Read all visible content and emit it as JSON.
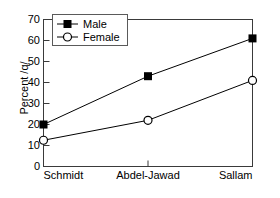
{
  "chart_data": {
    "type": "line",
    "title": "",
    "xlabel": "",
    "ylabel": "Percent /q/",
    "categories": [
      "Schmidt",
      "Abdel-Jawad",
      "Sallam"
    ],
    "series": [
      {
        "name": "Male",
        "values": [
          20,
          43,
          61
        ],
        "marker": "filled-square",
        "color": "#000000"
      },
      {
        "name": "Female",
        "values": [
          12.5,
          22,
          41
        ],
        "marker": "open-circle",
        "color": "#000000"
      }
    ],
    "ylim": [
      0,
      70
    ],
    "ytick_labels": [
      "0",
      "10",
      "20",
      "30",
      "40",
      "50",
      "60",
      "70"
    ],
    "ytick_values": [
      0,
      10,
      20,
      30,
      40,
      50,
      60,
      70
    ],
    "grid": false,
    "frame": true,
    "tick_direction": "in",
    "legend": {
      "position": "upper-left-inside",
      "bordered": true,
      "entries": [
        "Male",
        "Female"
      ]
    }
  }
}
